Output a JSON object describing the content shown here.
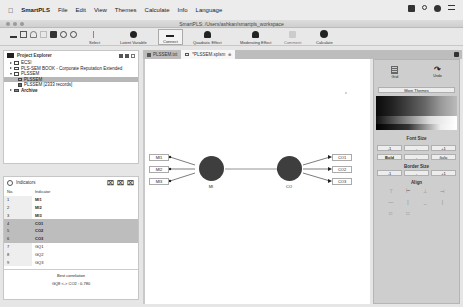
{
  "menubar": {
    "app_name": "SmartPLS",
    "items": [
      "File",
      "Edit",
      "View",
      "Themes",
      "Calculate",
      "Info",
      "Language"
    ]
  },
  "window": {
    "title": "SmartPLS: /Users/ashkan/smartpls_workspace"
  },
  "toolbar": {
    "buttons": [
      {
        "label": "Select"
      },
      {
        "label": "Latent Variable"
      },
      {
        "label": "Connect"
      },
      {
        "label": "Quadratic Effect"
      },
      {
        "label": "Moderating Effect"
      },
      {
        "label": "Comment"
      },
      {
        "label": "Calculate"
      }
    ]
  },
  "project_explorer": {
    "title": "Project Explorer",
    "items": [
      {
        "label": "ECSI",
        "level": 0,
        "expanded": false
      },
      {
        "label": "PLS-SEM BOOK - Corporate Reputation Extended",
        "level": 0,
        "expanded": false
      },
      {
        "label": "PLSSEM",
        "level": 0,
        "expanded": true
      },
      {
        "label": "PLSSEM",
        "level": 1,
        "selected": true
      },
      {
        "label": "PLSSEM [2333 records]",
        "level": 1
      },
      {
        "label": "Archive",
        "level": 0,
        "expanded": false
      }
    ]
  },
  "indicators": {
    "title": "Indicators",
    "columns": [
      "No.",
      "Indicator"
    ],
    "rows": [
      {
        "no": "1",
        "name": "MI1",
        "highlight": false
      },
      {
        "no": "2",
        "name": "MI2",
        "highlight": false
      },
      {
        "no": "3",
        "name": "MI3",
        "highlight": false
      },
      {
        "no": "4",
        "name": "CO1",
        "highlight": true
      },
      {
        "no": "5",
        "name": "CO2",
        "highlight": true
      },
      {
        "no": "6",
        "name": "CO3",
        "highlight": true
      },
      {
        "no": "7",
        "name": "GQ1",
        "highlight": false
      },
      {
        "no": "8",
        "name": "GQ2",
        "highlight": false
      },
      {
        "no": "9",
        "name": "GQ3",
        "highlight": false
      }
    ],
    "footer_label": "Best correlation",
    "footer_value": "GQ8 <-> CO2 : 0.780"
  },
  "editor_tabs": [
    {
      "label": "PLSSEM.txt",
      "active": false
    },
    {
      "label": "*PLSSEM.splsm",
      "active": true
    }
  ],
  "model": {
    "latent_variables": [
      {
        "name": "MI",
        "indicators": [
          "MI1",
          "MI2",
          "MI3"
        ]
      },
      {
        "name": "CO",
        "indicators": [
          "CO1",
          "CO2",
          "CO3"
        ]
      }
    ]
  },
  "right_panel": {
    "top_buttons": [
      "Grid",
      "Undo"
    ],
    "more_themes": "More Themes",
    "font_size": {
      "title": "Font Size",
      "buttons": [
        "-1",
        "-",
        "+1"
      ],
      "style_buttons": [
        "Bold",
        "-",
        "Italic"
      ]
    },
    "border_size": {
      "title": "Border Size",
      "buttons": [
        "-1",
        "-",
        "+1"
      ]
    },
    "align": {
      "title": "Align"
    }
  }
}
